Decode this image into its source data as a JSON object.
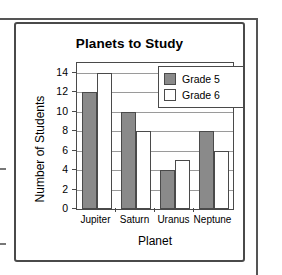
{
  "chart_data": {
    "type": "bar",
    "title": "Planets to Study",
    "xlabel": "Planet",
    "ylabel": "Number of Students",
    "categories": [
      "Jupiter",
      "Saturn",
      "Uranus",
      "Neptune"
    ],
    "series": [
      {
        "name": "Grade 5",
        "color": "#8a8a8a",
        "values": [
          12,
          10,
          4,
          8
        ]
      },
      {
        "name": "Grade 6",
        "color": "#ffffff",
        "values": [
          14,
          8,
          5,
          6
        ]
      }
    ],
    "ylim": [
      0,
      15
    ],
    "yticks": [
      0,
      2,
      4,
      6,
      8,
      10,
      12,
      14
    ],
    "ytick_labels": [
      "0",
      "2",
      "4",
      "6",
      "8",
      "10",
      "12",
      "14"
    ],
    "grid": true,
    "grid_axis": "y",
    "legend_position": "top-right",
    "bar_border_color": "#4a4a4a",
    "axis_color": "#4a4a4a",
    "grid_color": "#9a9a9a"
  },
  "legend": {
    "entries": [
      {
        "label": "Grade 5"
      },
      {
        "label": "Grade 6"
      }
    ]
  }
}
